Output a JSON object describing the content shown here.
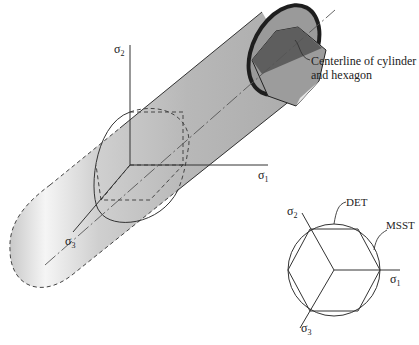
{
  "main_diagram": {
    "axes": {
      "sigma1_label": "σ",
      "sigma1_sub": "1",
      "sigma2_label": "σ",
      "sigma2_sub": "2",
      "sigma3_label": "σ",
      "sigma3_sub": "3"
    },
    "annotation": {
      "line1": "Centerline of cylinder",
      "line2": "and hexagon"
    }
  },
  "inset_diagram": {
    "det_label": "DET",
    "msst_label": "MSST",
    "sigma1_label": "σ",
    "sigma1_sub": "1",
    "sigma2_label": "σ",
    "sigma2_sub": "2",
    "sigma3_label": "σ",
    "sigma3_sub": "3"
  },
  "colors": {
    "cylinder_light": "#f4f4f4",
    "cylinder_mid": "#c8c8c8",
    "cylinder_dark": "#a8a8a8",
    "hexagon_face_dark": "#6a6a6a",
    "hexagon_face_mid": "#9a9a9a",
    "line": "#333333"
  }
}
